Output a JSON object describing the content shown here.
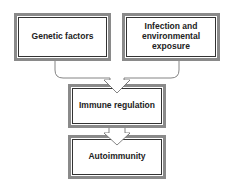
{
  "diagram": {
    "type": "flowchart",
    "nodes": [
      {
        "id": "genetic",
        "label": "Genetic factors"
      },
      {
        "id": "infection",
        "label": "Infection and\nenvironmental\nexposure"
      },
      {
        "id": "immune",
        "label": "Immune regulation"
      },
      {
        "id": "autoimmunity",
        "label": "Autoimmunity"
      }
    ],
    "edges": [
      {
        "from": "genetic",
        "to": "immune",
        "style": "merging bracket arrow"
      },
      {
        "from": "infection",
        "to": "immune",
        "style": "merging bracket arrow"
      },
      {
        "from": "immune",
        "to": "autoimmunity",
        "style": "block arrow"
      }
    ],
    "colors": {
      "outer_border": "#8a8a8a",
      "inner_border": "#333333",
      "text": "#222222",
      "arrow": "#555555"
    }
  }
}
